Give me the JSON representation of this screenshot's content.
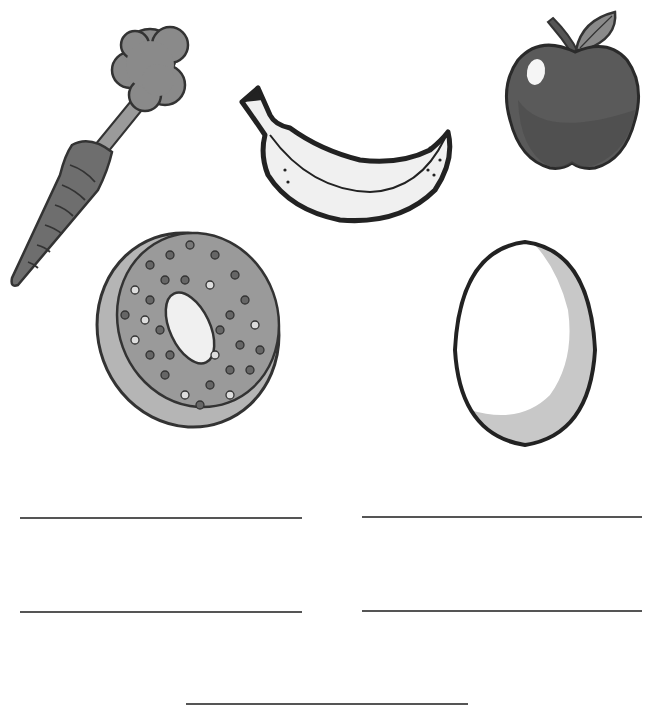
{
  "worksheet": {
    "items": [
      {
        "name": "carrot",
        "label": "carrot"
      },
      {
        "name": "banana",
        "label": "banana"
      },
      {
        "name": "apple",
        "label": "apple"
      },
      {
        "name": "donut",
        "label": "donut"
      },
      {
        "name": "egg",
        "label": "egg"
      }
    ],
    "answer_lines": [
      {
        "id": 1,
        "x1": 20,
        "x2": 302,
        "y": 518
      },
      {
        "id": 2,
        "x1": 362,
        "x2": 642,
        "y": 517
      },
      {
        "id": 3,
        "x1": 20,
        "x2": 302,
        "y": 612
      },
      {
        "id": 4,
        "x1": 362,
        "x2": 642,
        "y": 611
      },
      {
        "id": 5,
        "x1": 186,
        "x2": 468,
        "y": 704
      }
    ],
    "colors": {
      "outline": "#333333",
      "carrot": "#6e6e6e",
      "leaves": "#8a8a8a",
      "apple": "#5a5a5a",
      "donut_icing": "#9a9a9a",
      "donut_base": "#b5b5b5",
      "egg_shade": "#c8c8c8"
    }
  }
}
